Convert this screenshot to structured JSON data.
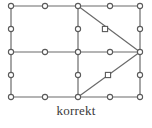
{
  "figure": {
    "caption": "korrekt",
    "colors": {
      "edge": "#6b6b6b",
      "node_stroke": "#5a5a5a",
      "node_fill": "#ffffff",
      "background": "#ffffff",
      "caption_text": "#3a3a3a"
    },
    "mesh": {
      "type": "finite-element-mesh",
      "edge_width": 1.2,
      "node_radius": 2.6,
      "nodes": [
        {
          "id": "n1",
          "x": 11,
          "y": 6,
          "shape": "circle",
          "role": "corner"
        },
        {
          "id": "n2",
          "x": 45,
          "y": 6,
          "shape": "circle",
          "role": "midside"
        },
        {
          "id": "n3",
          "x": 78,
          "y": 6,
          "shape": "circle",
          "role": "corner"
        },
        {
          "id": "n4",
          "x": 110,
          "y": 6,
          "shape": "circle",
          "role": "midside"
        },
        {
          "id": "n5",
          "x": 140,
          "y": 6,
          "shape": "circle",
          "role": "corner"
        },
        {
          "id": "n6",
          "x": 11,
          "y": 29,
          "shape": "circle",
          "role": "midside"
        },
        {
          "id": "n7",
          "x": 78,
          "y": 29,
          "shape": "circle",
          "role": "midside"
        },
        {
          "id": "n8",
          "x": 105,
          "y": 29,
          "shape": "square",
          "role": "midside-diagonal"
        },
        {
          "id": "n9",
          "x": 140,
          "y": 29,
          "shape": "circle",
          "role": "midside"
        },
        {
          "id": "n10",
          "x": 11,
          "y": 52,
          "shape": "circle",
          "role": "corner"
        },
        {
          "id": "n11",
          "x": 45,
          "y": 52,
          "shape": "circle",
          "role": "midside"
        },
        {
          "id": "n12",
          "x": 78,
          "y": 52,
          "shape": "circle",
          "role": "corner"
        },
        {
          "id": "n13",
          "x": 110,
          "y": 52,
          "shape": "circle",
          "role": "midside"
        },
        {
          "id": "n14",
          "x": 140,
          "y": 52,
          "shape": "circle",
          "role": "corner-apex"
        },
        {
          "id": "n15",
          "x": 11,
          "y": 75,
          "shape": "circle",
          "role": "midside"
        },
        {
          "id": "n16",
          "x": 78,
          "y": 75,
          "shape": "circle",
          "role": "midside"
        },
        {
          "id": "n17",
          "x": 108,
          "y": 75,
          "shape": "square",
          "role": "midside-diagonal"
        },
        {
          "id": "n18",
          "x": 140,
          "y": 75,
          "shape": "circle",
          "role": "midside"
        },
        {
          "id": "n19",
          "x": 11,
          "y": 97,
          "shape": "circle",
          "role": "corner"
        },
        {
          "id": "n20",
          "x": 45,
          "y": 97,
          "shape": "circle",
          "role": "midside"
        },
        {
          "id": "n21",
          "x": 78,
          "y": 97,
          "shape": "circle",
          "role": "corner"
        },
        {
          "id": "n22",
          "x": 110,
          "y": 97,
          "shape": "circle",
          "role": "midside"
        },
        {
          "id": "n23",
          "x": 140,
          "y": 97,
          "shape": "circle",
          "role": "corner"
        }
      ],
      "edges": [
        {
          "x1": 11,
          "y1": 6,
          "x2": 140,
          "y2": 6,
          "kind": "top-boundary"
        },
        {
          "x1": 11,
          "y1": 52,
          "x2": 140,
          "y2": 52,
          "kind": "middle-horizontal"
        },
        {
          "x1": 11,
          "y1": 97,
          "x2": 140,
          "y2": 97,
          "kind": "bottom-boundary"
        },
        {
          "x1": 11,
          "y1": 6,
          "x2": 11,
          "y2": 97,
          "kind": "left-boundary"
        },
        {
          "x1": 78,
          "y1": 6,
          "x2": 78,
          "y2": 97,
          "kind": "center-vertical"
        },
        {
          "x1": 140,
          "y1": 6,
          "x2": 140,
          "y2": 97,
          "kind": "right-boundary"
        },
        {
          "x1": 78,
          "y1": 6,
          "x2": 140,
          "y2": 52,
          "kind": "upper-diagonal"
        },
        {
          "x1": 78,
          "y1": 97,
          "x2": 140,
          "y2": 52,
          "kind": "lower-diagonal"
        }
      ],
      "elements": [
        {
          "id": "e1",
          "type": "quad",
          "corners": [
            "n1",
            "n3",
            "n12",
            "n10"
          ]
        },
        {
          "id": "e2",
          "type": "quad",
          "corners": [
            "n10",
            "n12",
            "n21",
            "n19"
          ]
        },
        {
          "id": "e3",
          "type": "triangle",
          "corners": [
            "n3",
            "n5",
            "n14"
          ]
        },
        {
          "id": "e4",
          "type": "triangle",
          "corners": [
            "n3",
            "n14",
            "n12"
          ]
        },
        {
          "id": "e5",
          "type": "triangle",
          "corners": [
            "n12",
            "n14",
            "n21"
          ]
        },
        {
          "id": "e6",
          "type": "triangle",
          "corners": [
            "n21",
            "n14",
            "n23"
          ]
        }
      ]
    }
  }
}
